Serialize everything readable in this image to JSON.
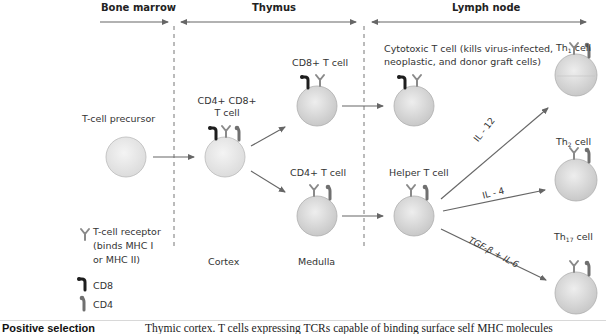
{
  "regions": {
    "bone_marrow": "Bone marrow",
    "thymus": "Thymus",
    "lymph_node": "Lymph node"
  },
  "cells": {
    "precursor": "T-cell precursor",
    "double_positive_line1": "CD4+ CD8+",
    "double_positive_line2": "T cell",
    "cd8_t_cell": "CD8+ T cell",
    "cd4_t_cell": "CD4+ T cell",
    "cytotoxic_line1": "Cytotoxic T cell (kills virus-infected,",
    "cytotoxic_line2": "neoplastic, and donor graft cells)",
    "helper": "Helper T cell",
    "th1_main": "Th",
    "th1_sub": "1",
    "th1_suffix": " cell",
    "th2_main": "Th",
    "th2_sub": "2",
    "th2_suffix": " cell",
    "th17_main": "Th",
    "th17_sub": "17",
    "th17_suffix": " cell"
  },
  "locations": {
    "cortex": "Cortex",
    "medulla": "Medulla"
  },
  "cytokines": {
    "il12": "IL - 12",
    "il4": "IL - 4",
    "tgf_il6": "TGF-β + IL-6"
  },
  "legend": {
    "tcr_line1": "T-cell receptor",
    "tcr_line2": "(binds MHC I",
    "tcr_line3": "or MHC II)",
    "cd8": "CD8",
    "cd4": "CD4"
  },
  "footer": {
    "title": "Positive selection",
    "text": "Thymic cortex. T cells expressing TCRs capable of binding surface self MHC molecules"
  },
  "colors": {
    "cell_fill": "#d9d9d9",
    "arrow": "#666666",
    "cd8_marker": "#1e1e1e",
    "cd4_marker": "#707070",
    "tcr": "#8a8a8a"
  }
}
